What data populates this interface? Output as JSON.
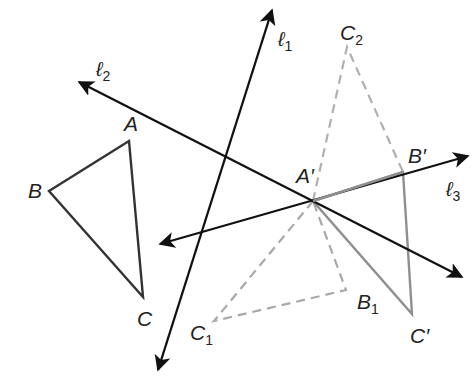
{
  "diagram": {
    "colors": {
      "line": "#111111",
      "original_triangle": "#333333",
      "image_triangle": "#8f8f8f",
      "intermediate_dashed": "#a8a8a8"
    },
    "lines": [
      {
        "id": "l1",
        "label": "ℓ",
        "sub": "1",
        "from": [
          158,
          370
        ],
        "to": [
          272,
          10
        ],
        "arrows": "both"
      },
      {
        "id": "l2",
        "label": "ℓ",
        "sub": "2",
        "from": [
          79,
          82
        ],
        "to": [
          462,
          277
        ],
        "arrows": "both"
      },
      {
        "id": "l3",
        "label": "ℓ",
        "sub": "3",
        "from": [
          160,
          244
        ],
        "to": [
          468,
          156
        ],
        "arrows": "both"
      }
    ],
    "points": {
      "A": {
        "label": "A",
        "pos": [
          129,
          141
        ]
      },
      "B": {
        "label": "B",
        "pos": [
          49,
          191
        ]
      },
      "C": {
        "label": "C",
        "pos": [
          143,
          297
        ]
      },
      "A_prime": {
        "label": "A′",
        "pos": [
          313,
          201
        ]
      },
      "B_prime": {
        "label": "B′",
        "pos": [
          403,
          172
        ]
      },
      "C_prime": {
        "label": "C′",
        "pos": [
          412,
          314
        ]
      },
      "C2": {
        "label": "C",
        "sub": "2",
        "pos": [
          347,
          47
        ]
      },
      "B1": {
        "label": "B",
        "sub": "1",
        "pos": [
          346,
          290
        ]
      },
      "C1": {
        "label": "C",
        "sub": "1",
        "pos": [
          214,
          321
        ]
      }
    },
    "triangles": [
      {
        "name": "ABC",
        "style": "solid-dark",
        "vertices": [
          "A",
          "B",
          "C"
        ]
      },
      {
        "name": "A'B'C'",
        "style": "solid-gray",
        "vertices": [
          "A_prime",
          "B_prime",
          "C_prime"
        ]
      },
      {
        "name": "A'B1C1",
        "style": "dashed-gray",
        "vertices": [
          "A_prime",
          "B1",
          "C1"
        ]
      },
      {
        "name": "A'B'C2",
        "style": "dashed-gray",
        "vertices": [
          "A_prime",
          "B_prime",
          "C2"
        ]
      }
    ],
    "labels": {
      "l1": {
        "text": "ℓ",
        "sub": "1"
      },
      "l2": {
        "text": "ℓ",
        "sub": "2"
      },
      "l3": {
        "text": "ℓ",
        "sub": "3"
      },
      "A": "A",
      "B": "B",
      "C": "C",
      "A_prime": "A′",
      "B_prime": "B′",
      "C_prime": "C′",
      "C2": {
        "text": "C",
        "sub": "2"
      },
      "B1": {
        "text": "B",
        "sub": "1"
      },
      "C1": {
        "text": "C",
        "sub": "1"
      }
    }
  }
}
